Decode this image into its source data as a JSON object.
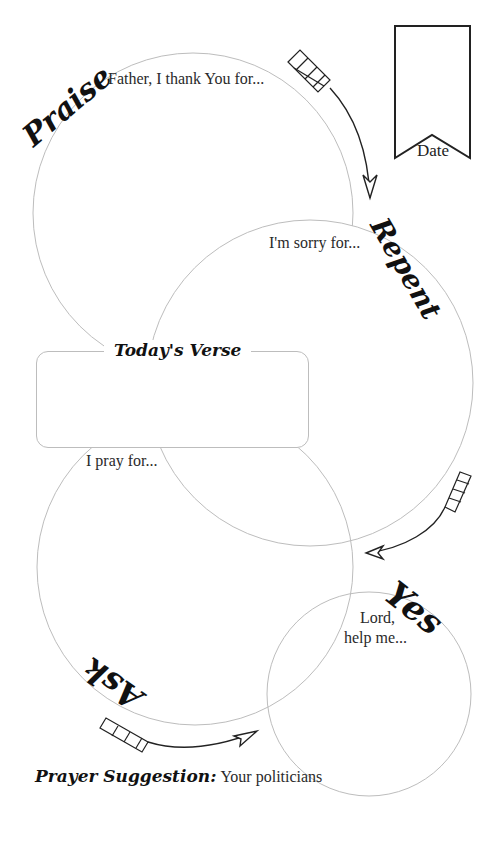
{
  "colors": {
    "circle_stroke": "#bdbdbd",
    "ink": "#111111",
    "text": "#2a2a2a",
    "background": "#ffffff"
  },
  "date": {
    "label": "Date"
  },
  "sections": {
    "praise": {
      "heading": "Praise",
      "prompt": "Father, I thank You for..."
    },
    "repent": {
      "heading": "Repent",
      "prompt": "I'm sorry for..."
    },
    "ask": {
      "heading": "Ask",
      "prompt": "I pray for..."
    },
    "yes": {
      "heading": "Yes",
      "prompt_line1": "Lord,",
      "prompt_line2": "help me..."
    }
  },
  "verse": {
    "title": "Today's Verse",
    "content": ""
  },
  "prayer_suggestion": {
    "label": "Prayer Suggestion:",
    "value": "Your politicians"
  },
  "icons": {
    "arrow_1": "arrow-icon",
    "arrow_2": "arrow-icon",
    "arrow_3": "arrow-icon",
    "bookmark": "bookmark-icon"
  }
}
